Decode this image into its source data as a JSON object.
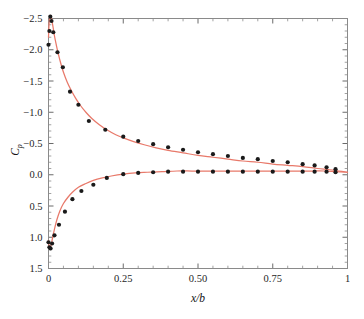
{
  "chart_data": {
    "type": "scatter",
    "title": "",
    "subtitle": "",
    "xlabel": "x/b",
    "ylabel": "Cp",
    "ylabel_base": "C",
    "ylabel_sub": "p",
    "xlim": [
      0,
      1
    ],
    "ylim": [
      1.5,
      -2.5
    ],
    "y_inverted": true,
    "grid": false,
    "legend": null,
    "xticks": [
      0,
      0.25,
      0.5,
      0.75,
      1
    ],
    "xticklabels": [
      "0",
      "0.25",
      "0.50",
      "0.75",
      "1"
    ],
    "yticks": [
      -2.5,
      -2.0,
      -1.5,
      -1.0,
      -0.5,
      0.0,
      0.5,
      1.0,
      1.5
    ],
    "yticklabels": [
      "-2.5",
      "-2.0",
      "-1.5",
      "-1.0",
      "-0.5",
      "0.0",
      "0.5",
      "1.0",
      "1.5"
    ],
    "x_minor_count": 4,
    "y_minor_count": 4,
    "colors": {
      "curve": "#e8796a",
      "marker": "#1a1a1a",
      "frame": "#8a8a8a",
      "text": "#1a1a1a",
      "background": "#ffffff"
    },
    "series": [
      {
        "name": "upper-surface-fit",
        "kind": "line",
        "color": "#e8796a",
        "x": [
          0.0,
          0.002,
          0.004,
          0.006,
          0.009,
          0.012,
          0.016,
          0.02,
          0.026,
          0.032,
          0.04,
          0.05,
          0.062,
          0.075,
          0.09,
          0.105,
          0.125,
          0.145,
          0.17,
          0.195,
          0.225,
          0.25,
          0.285,
          0.32,
          0.36,
          0.4,
          0.45,
          0.5,
          0.55,
          0.6,
          0.65,
          0.7,
          0.75,
          0.8,
          0.85,
          0.9,
          0.94,
          0.97,
          1.0
        ],
        "y": [
          -2.2,
          -2.42,
          -2.52,
          -2.55,
          -2.52,
          -2.45,
          -2.34,
          -2.22,
          -2.08,
          -1.95,
          -1.8,
          -1.64,
          -1.49,
          -1.36,
          -1.23,
          -1.12,
          -1.0,
          -0.9,
          -0.8,
          -0.72,
          -0.64,
          -0.59,
          -0.53,
          -0.48,
          -0.43,
          -0.39,
          -0.35,
          -0.31,
          -0.28,
          -0.25,
          -0.22,
          -0.2,
          -0.17,
          -0.15,
          -0.13,
          -0.1,
          -0.08,
          -0.06,
          -0.04
        ]
      },
      {
        "name": "lower-surface-fit",
        "kind": "line",
        "color": "#e8796a",
        "x": [
          0.0,
          0.002,
          0.004,
          0.007,
          0.01,
          0.014,
          0.02,
          0.028,
          0.038,
          0.05,
          0.065,
          0.08,
          0.1,
          0.125,
          0.15,
          0.18,
          0.21,
          0.25,
          0.29,
          0.33,
          0.38,
          0.43,
          0.48,
          0.53,
          0.58,
          0.63,
          0.68,
          0.73,
          0.78,
          0.83,
          0.88,
          0.92,
          0.96,
          1.0
        ],
        "y": [
          1.05,
          1.14,
          1.18,
          1.16,
          1.1,
          1.0,
          0.87,
          0.72,
          0.58,
          0.46,
          0.36,
          0.28,
          0.2,
          0.14,
          0.09,
          0.05,
          0.02,
          -0.01,
          -0.03,
          -0.04,
          -0.05,
          -0.06,
          -0.06,
          -0.06,
          -0.06,
          -0.06,
          -0.06,
          -0.06,
          -0.06,
          -0.06,
          -0.06,
          -0.06,
          -0.05,
          -0.04
        ]
      },
      {
        "name": "upper-surface-measured",
        "kind": "scatter",
        "color": "#1a1a1a",
        "x": [
          0.0,
          0.003,
          0.006,
          0.01,
          0.016,
          0.03,
          0.048,
          0.072,
          0.1,
          0.135,
          0.19,
          0.25,
          0.3,
          0.35,
          0.4,
          0.45,
          0.5,
          0.55,
          0.6,
          0.65,
          0.7,
          0.75,
          0.8,
          0.85,
          0.89,
          0.93,
          0.96
        ],
        "y": [
          -2.08,
          -2.3,
          -2.53,
          -2.46,
          -2.28,
          -1.96,
          -1.72,
          -1.33,
          -1.12,
          -0.86,
          -0.72,
          -0.61,
          -0.54,
          -0.49,
          -0.44,
          -0.4,
          -0.36,
          -0.33,
          -0.3,
          -0.27,
          -0.25,
          -0.22,
          -0.2,
          -0.17,
          -0.15,
          -0.12,
          -0.09
        ]
      },
      {
        "name": "lower-surface-measured",
        "kind": "scatter",
        "color": "#1a1a1a",
        "x": [
          0.0,
          0.003,
          0.007,
          0.012,
          0.02,
          0.035,
          0.055,
          0.08,
          0.11,
          0.15,
          0.195,
          0.25,
          0.3,
          0.35,
          0.4,
          0.45,
          0.5,
          0.55,
          0.6,
          0.65,
          0.7,
          0.75,
          0.8,
          0.85,
          0.89,
          0.93,
          0.96
        ],
        "y": [
          1.08,
          1.16,
          1.18,
          1.1,
          0.97,
          0.8,
          0.59,
          0.39,
          0.26,
          0.16,
          0.05,
          -0.01,
          -0.03,
          -0.04,
          -0.05,
          -0.05,
          -0.05,
          -0.05,
          -0.05,
          -0.05,
          -0.05,
          -0.05,
          -0.05,
          -0.05,
          -0.05,
          -0.05,
          -0.04
        ]
      }
    ]
  }
}
